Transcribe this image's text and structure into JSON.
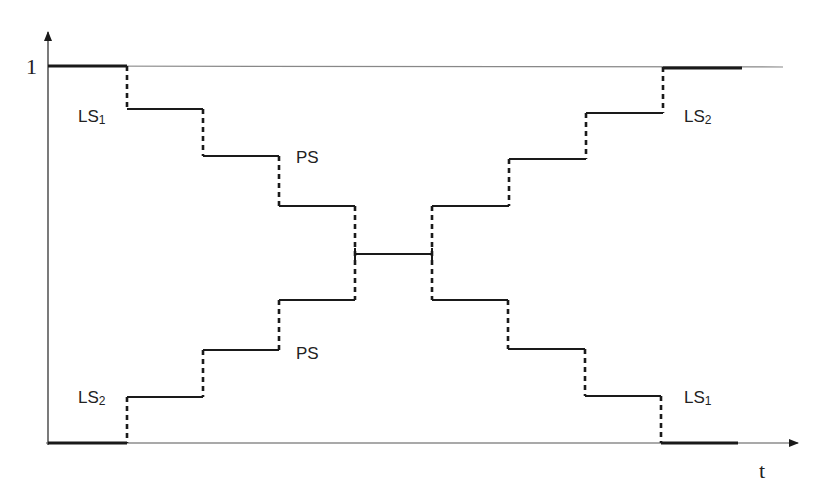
{
  "diagram": {
    "type": "step-transition",
    "y_axis_label": "1",
    "x_axis_label": "t",
    "colors": {
      "line": "#1a1a1a",
      "reference": "#888888",
      "text": "#222222"
    }
  },
  "labels": {
    "ls1_top": {
      "base": "LS",
      "sub": "1"
    },
    "ps_top": "PS",
    "ls2_top": {
      "base": "LS",
      "sub": "2"
    },
    "ls2_bottom": {
      "base": "LS",
      "sub": "2"
    },
    "ps_bottom": "PS",
    "ls1_bottom": {
      "base": "LS",
      "sub": "1"
    }
  },
  "curves": {
    "descending_left": [
      {
        "x1": 48,
        "x2": 127,
        "y": 66,
        "thick": true
      },
      {
        "x1": 127,
        "x2": 203,
        "y": 109
      },
      {
        "x1": 203,
        "x2": 279,
        "y": 156
      },
      {
        "x1": 279,
        "x2": 355,
        "y": 206
      },
      {
        "x1": 355,
        "x2": 432,
        "y": 254
      }
    ],
    "ascending_left": [
      {
        "x1": 48,
        "x2": 127,
        "y": 443,
        "thick": true
      },
      {
        "x1": 127,
        "x2": 203,
        "y": 397
      },
      {
        "x1": 203,
        "x2": 279,
        "y": 350
      },
      {
        "x1": 279,
        "x2": 355,
        "y": 300
      }
    ],
    "ascending_right": [
      {
        "x1": 432,
        "x2": 509,
        "y": 206
      },
      {
        "x1": 509,
        "x2": 586,
        "y": 159
      },
      {
        "x1": 586,
        "x2": 663,
        "y": 113
      },
      {
        "x1": 663,
        "x2": 742,
        "y": 67,
        "thick": true
      }
    ],
    "descending_right": [
      {
        "x1": 432,
        "x2": 508,
        "y": 300
      },
      {
        "x1": 508,
        "x2": 585,
        "y": 349
      },
      {
        "x1": 585,
        "x2": 661,
        "y": 396
      },
      {
        "x1": 661,
        "x2": 738,
        "y": 443,
        "thick": true
      }
    ]
  }
}
